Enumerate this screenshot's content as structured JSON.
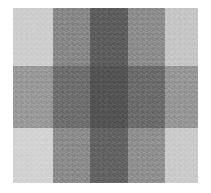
{
  "image": {
    "title": "Grayscale checkerboard intensity grid",
    "background_color": "#ffffff",
    "width": 211,
    "height": 193
  },
  "plate": {
    "left": 13,
    "top": 8,
    "width": 185,
    "height": 175,
    "column_boundaries": [
      13,
      53,
      90,
      128,
      165,
      198
    ],
    "row_boundaries": [
      8,
      66,
      128,
      183
    ]
  },
  "grid": {
    "columns": 5,
    "rows": 3,
    "column_widths": [
      40,
      37,
      38,
      37,
      33
    ],
    "row_heights": [
      58,
      62,
      55
    ],
    "column_labels": [
      "c1",
      "c2",
      "c3",
      "c4",
      "c5"
    ],
    "row_labels": [
      "r1",
      "r2",
      "r3"
    ],
    "cells": [
      [
        {
          "name": "cell-r1c1",
          "color": "#cecece",
          "level": "lightest"
        },
        {
          "name": "cell-r1c2",
          "color": "#888888",
          "level": "medium"
        },
        {
          "name": "cell-r1c3",
          "color": "#5e5e5e",
          "level": "dark"
        },
        {
          "name": "cell-r1c4",
          "color": "#8d8d8d",
          "level": "medium"
        },
        {
          "name": "cell-r1c5",
          "color": "#c6c6c6",
          "level": "lightest"
        }
      ],
      [
        {
          "name": "cell-r2c1",
          "color": "#9a9a9a",
          "level": "medium"
        },
        {
          "name": "cell-r2c2",
          "color": "#6f6f6f",
          "level": "dark"
        },
        {
          "name": "cell-r2c3",
          "color": "#545454",
          "level": "darkest"
        },
        {
          "name": "cell-r2c4",
          "color": "#6c6c6c",
          "level": "dark"
        },
        {
          "name": "cell-r2c5",
          "color": "#979797",
          "level": "medium"
        }
      ],
      [
        {
          "name": "cell-r3c1",
          "color": "#d3d3d3",
          "level": "lightest"
        },
        {
          "name": "cell-r3c2",
          "color": "#8c8c8c",
          "level": "medium"
        },
        {
          "name": "cell-r3c3",
          "color": "#636363",
          "level": "dark"
        },
        {
          "name": "cell-r3c4",
          "color": "#909090",
          "level": "medium"
        },
        {
          "name": "cell-r3c5",
          "color": "#cbcbcb",
          "level": "lightest"
        }
      ]
    ]
  }
}
